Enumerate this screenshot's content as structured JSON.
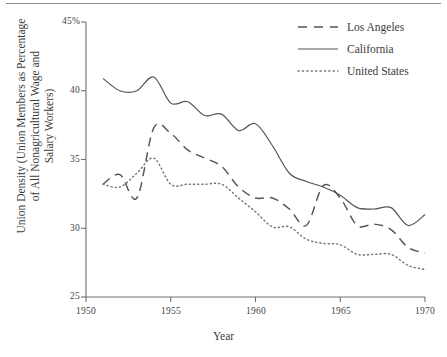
{
  "chart_data": {
    "type": "line",
    "title": "",
    "xlabel": "Year",
    "ylabel": "Union Density (Union Members as Percentage of All Nonagricultural Wage and Salary Workers)",
    "xlim": [
      1950,
      1970
    ],
    "ylim": [
      25,
      45
    ],
    "xticks": [
      1950,
      1955,
      1960,
      1965,
      1970
    ],
    "xtick_labels": [
      "1950",
      "1955",
      "1960",
      "1965",
      "1970"
    ],
    "yticks": [
      25,
      30,
      35,
      40,
      45
    ],
    "ytick_labels": [
      "25",
      "30",
      "35",
      "40",
      "45%"
    ],
    "grid": false,
    "legend_position": "top-right",
    "x": [
      1951,
      1952,
      1953,
      1954,
      1955,
      1956,
      1957,
      1958,
      1959,
      1960,
      1961,
      1962,
      1963,
      1964,
      1965,
      1966,
      1967,
      1968,
      1969,
      1970
    ],
    "series": [
      {
        "name": "Los Angeles",
        "style": "dashed",
        "color": "#555555",
        "x": [
          1951,
          1952,
          1953,
          1954,
          1955,
          1956,
          1957,
          1958,
          1959,
          1960,
          1961,
          1962,
          1963,
          1964,
          1965,
          1966,
          1967,
          1968,
          1969,
          1970
        ],
        "values": [
          33.2,
          33.9,
          32.2,
          37.3,
          36.9,
          35.7,
          35.1,
          34.5,
          33.0,
          32.2,
          32.2,
          31.4,
          30.2,
          33.1,
          32.2,
          30.2,
          30.3,
          29.9,
          28.6,
          28.2
        ]
      },
      {
        "name": "California",
        "style": "solid",
        "color": "#555555",
        "x": [
          1951,
          1952,
          1953,
          1954,
          1955,
          1956,
          1957,
          1958,
          1959,
          1960,
          1961,
          1962,
          1963,
          1964,
          1965,
          1966,
          1967,
          1968,
          1969,
          1970
        ],
        "values": [
          40.9,
          40.0,
          40.0,
          41.0,
          39.1,
          39.2,
          38.2,
          38.3,
          37.1,
          37.6,
          36.0,
          34.0,
          33.4,
          33.0,
          32.4,
          31.5,
          31.4,
          31.5,
          30.2,
          31.0
        ]
      },
      {
        "name": "United States",
        "style": "dotted",
        "color": "#777777",
        "x": [
          1951,
          1952,
          1953,
          1954,
          1955,
          1956,
          1957,
          1958,
          1959,
          1960,
          1961,
          1962,
          1963,
          1964,
          1965,
          1966,
          1967,
          1968,
          1969,
          1970
        ],
        "values": [
          33.2,
          33.0,
          34.0,
          35.1,
          33.2,
          33.2,
          33.2,
          33.2,
          32.2,
          31.2,
          30.1,
          30.1,
          29.2,
          28.9,
          28.8,
          28.1,
          28.1,
          28.1,
          27.3,
          27.0
        ]
      }
    ]
  },
  "axes": {
    "x_title": "Year",
    "y_title_line1": "Union Density (Union Members as Percentage",
    "y_title_line2": "of All Nonagricultural Wage and",
    "y_title_line3": "Salary Workers)"
  },
  "legend": {
    "items": [
      {
        "label": "Los Angeles",
        "key": "dashed-line-key"
      },
      {
        "label": "California",
        "key": "solid-line-key"
      },
      {
        "label": "United States",
        "key": "dotted-line-key"
      }
    ]
  }
}
